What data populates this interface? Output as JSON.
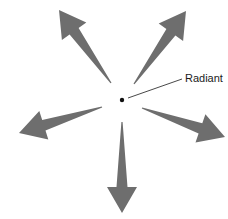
{
  "diagram": {
    "colors": {
      "arrow": "#6e6e6e",
      "dot": "#111111",
      "leader": "#333333",
      "background": "#ffffff"
    },
    "radiant": {
      "label": "Radiant",
      "center": [
        122,
        100
      ]
    },
    "arrows": [
      {
        "name": "upper-left",
        "tail": [
          111,
          83
        ],
        "tip": [
          59,
          10
        ]
      },
      {
        "name": "upper-right",
        "tail": [
          134,
          84
        ],
        "tip": [
          186,
          11
        ]
      },
      {
        "name": "left",
        "tail": [
          102,
          107
        ],
        "tip": [
          19,
          133
        ]
      },
      {
        "name": "right",
        "tail": [
          142,
          108
        ],
        "tip": [
          225,
          137
        ]
      },
      {
        "name": "down",
        "tail": [
          122,
          122
        ],
        "tip": [
          122,
          213
        ]
      }
    ]
  }
}
